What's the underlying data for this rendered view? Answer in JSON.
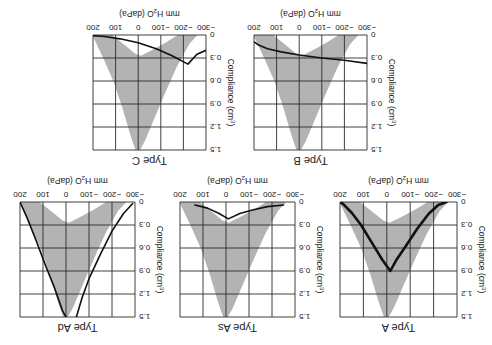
{
  "figure": {
    "rotation_deg": 180,
    "shade_color": "#b3b3b3",
    "curve_color": "#111111",
    "grid_color": "#2b2b2b"
  },
  "chart_data": [
    {
      "type": "line",
      "title": "Type A",
      "xlabel": "mm H2O (daPa)",
      "ylabel": "Compliance (cm3)",
      "xlim": [
        -300,
        200
      ],
      "ylim": [
        0,
        1.5
      ],
      "xticks": [
        "-300",
        "-200",
        "-100",
        "0",
        "100",
        "200"
      ],
      "yticks": [
        "0",
        "0.3",
        "0.6",
        "0.9",
        "1.2",
        "1.5"
      ],
      "grid": true,
      "normal_range_shaded": true,
      "series": [
        {
          "name": "Type A",
          "stroke_width": 2.6,
          "points": [
            [
              -255,
              0
            ],
            [
              -220,
              0.04
            ],
            [
              -180,
              0.15
            ],
            [
              -130,
              0.35
            ],
            [
              -80,
              0.58
            ],
            [
              -40,
              0.76
            ],
            [
              -15,
              0.9
            ],
            [
              20,
              0.75
            ],
            [
              60,
              0.55
            ],
            [
              110,
              0.3
            ],
            [
              150,
              0.14
            ],
            [
              185,
              0.03
            ],
            [
              200,
              0
            ]
          ]
        }
      ]
    },
    {
      "type": "line",
      "title": "Type As",
      "xlabel": "mm H2O (daPa)",
      "ylabel": "Compliance (cm3)",
      "xlim": [
        -300,
        200
      ],
      "ylim": [
        0,
        1.5
      ],
      "xticks": [
        "-300",
        "-200",
        "-100",
        "0",
        "100",
        "200"
      ],
      "yticks": [
        "0",
        "0.3",
        "0.6",
        "0.9",
        "1.2",
        "1.5"
      ],
      "grid": true,
      "normal_range_shaded": true,
      "series": [
        {
          "name": "Type As",
          "stroke_width": 1.6,
          "points": [
            [
              -250,
              0.04
            ],
            [
              -180,
              0.06
            ],
            [
              -120,
              0.1
            ],
            [
              -60,
              0.15
            ],
            [
              -10,
              0.22
            ],
            [
              30,
              0.15
            ],
            [
              80,
              0.08
            ],
            [
              135,
              0.04
            ]
          ]
        }
      ]
    },
    {
      "type": "line",
      "title": "Type Ad",
      "xlabel": "mm H2O (daPa)",
      "ylabel": "Compliance (cm3)",
      "xlim": [
        -300,
        200
      ],
      "ylim": [
        0,
        1.5
      ],
      "xticks": [
        "-300",
        "-200",
        "-100",
        "0",
        "100",
        "200"
      ],
      "yticks": [
        "0",
        "0.3",
        "0.6",
        "0.9",
        "1.2",
        "1.5"
      ],
      "grid": true,
      "normal_range_shaded": true,
      "series": [
        {
          "name": "Type Ad (negative side)",
          "stroke_width": 1.6,
          "points": [
            [
              -290,
              0.02
            ],
            [
              -250,
              0.15
            ],
            [
              -200,
              0.38
            ],
            [
              -150,
              0.68
            ],
            [
              -100,
              1.0
            ],
            [
              -70,
              1.25
            ],
            [
              -45,
              1.5
            ]
          ]
        },
        {
          "name": "Type Ad (positive side)",
          "stroke_width": 1.6,
          "points": [
            [
              200,
              0
            ],
            [
              170,
              0.2
            ],
            [
              130,
              0.5
            ],
            [
              90,
              0.82
            ],
            [
              50,
              1.12
            ],
            [
              15,
              1.42
            ],
            [
              0,
              1.5
            ]
          ]
        }
      ]
    },
    {
      "type": "line",
      "title": "Type B",
      "xlabel": "mm H2O (daPa)",
      "ylabel": "Compliance (cm3)",
      "xlim": [
        -300,
        200
      ],
      "ylim": [
        0,
        1.5
      ],
      "xticks": [
        "-300",
        "-200",
        "-100",
        "0",
        "100",
        "200"
      ],
      "yticks": [
        "0",
        "0.3",
        "0.6",
        "0.9",
        "1.2",
        "1.5"
      ],
      "grid": true,
      "normal_range_shaded": true,
      "series": [
        {
          "name": "Type B",
          "stroke_width": 1.6,
          "points": [
            [
              -300,
              0.37
            ],
            [
              -200,
              0.33
            ],
            [
              -100,
              0.3
            ],
            [
              0,
              0.26
            ],
            [
              80,
              0.22
            ],
            [
              140,
              0.18
            ],
            [
              180,
              0.13
            ],
            [
              200,
              0.09
            ]
          ]
        }
      ]
    },
    {
      "type": "line",
      "title": "Type C",
      "xlabel": "mm H2O (daPa)",
      "ylabel": "Compliance (cm3)",
      "xlim": [
        -300,
        200
      ],
      "ylim": [
        0,
        1.5
      ],
      "xticks": [
        "-300",
        "-200",
        "-100",
        "0",
        "100",
        "200"
      ],
      "yticks": [
        "0",
        "0.3",
        "0.6",
        "0.9",
        "1.2",
        "1.5"
      ],
      "grid": true,
      "normal_range_shaded": true,
      "series": [
        {
          "name": "Type C",
          "stroke_width": 1.6,
          "points": [
            [
              -300,
              0.2
            ],
            [
              -260,
              0.25
            ],
            [
              -220,
              0.38
            ],
            [
              -150,
              0.27
            ],
            [
              -80,
              0.18
            ],
            [
              0,
              0.1
            ],
            [
              80,
              0.05
            ],
            [
              150,
              0.02
            ],
            [
              200,
              0.01
            ]
          ]
        }
      ]
    }
  ],
  "normal_range": {
    "outer": [
      [
        -262,
        0
      ],
      [
        -225,
        0.12
      ],
      [
        -170,
        0.42
      ],
      [
        -120,
        0.75
      ],
      [
        -70,
        1.1
      ],
      [
        -30,
        1.38
      ],
      [
        -8,
        1.5
      ],
      [
        12,
        1.5
      ],
      [
        35,
        1.3
      ],
      [
        70,
        0.95
      ],
      [
        110,
        0.6
      ],
      [
        155,
        0.3
      ],
      [
        190,
        0.08
      ],
      [
        200,
        0.02
      ],
      [
        200,
        0
      ]
    ],
    "inner": [
      [
        115,
        0
      ],
      [
        60,
        0.13
      ],
      [
        15,
        0.24
      ],
      [
        -12,
        0.27
      ],
      [
        -60,
        0.2
      ],
      [
        -120,
        0.1
      ],
      [
        -175,
        0
      ]
    ]
  },
  "layout": {
    "panels": [
      {
        "gx": 35,
        "gy": 28,
        "w": 117,
        "h": 115
      },
      {
        "gx": 197,
        "gy": 28,
        "w": 115,
        "h": 115
      },
      {
        "gx": 357,
        "gy": 28,
        "w": 115,
        "h": 115
      },
      {
        "gx": 125,
        "gy": 195,
        "w": 113,
        "h": 115
      },
      {
        "gx": 286,
        "gy": 195,
        "w": 113,
        "h": 115
      }
    ]
  }
}
